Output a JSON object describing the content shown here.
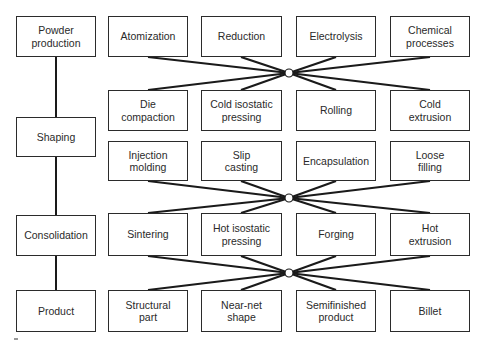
{
  "stages": [
    {
      "label": "Powder\nproduction"
    },
    {
      "label": "Shaping"
    },
    {
      "label": "Consolidation"
    },
    {
      "label": "Product"
    }
  ],
  "powder_production_methods": [
    {
      "label": "Atomization"
    },
    {
      "label": "Reduction"
    },
    {
      "label": "Electrolysis"
    },
    {
      "label": "Chemical\nprocesses"
    }
  ],
  "shaping_methods_row1": [
    {
      "label": "Die\ncompaction"
    },
    {
      "label": "Cold isostatic\npressing"
    },
    {
      "label": "Rolling"
    },
    {
      "label": "Cold\nextrusion"
    }
  ],
  "shaping_methods_row2": [
    {
      "label": "Injection\nmolding"
    },
    {
      "label": "Slip\ncasting"
    },
    {
      "label": "Encapsulation"
    },
    {
      "label": "Loose\nfilling"
    }
  ],
  "consolidation_methods": [
    {
      "label": "Sintering"
    },
    {
      "label": "Hot isostatic\npressing"
    },
    {
      "label": "Forging"
    },
    {
      "label": "Hot\nextrusion"
    }
  ],
  "products": [
    {
      "label": "Structural\npart"
    },
    {
      "label": "Near-net\nshape"
    },
    {
      "label": "Semifinished\nproduct"
    },
    {
      "label": "Billet"
    }
  ]
}
